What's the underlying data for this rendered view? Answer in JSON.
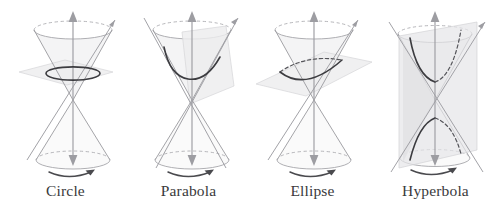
{
  "figure": {
    "background_color": "#ffffff",
    "label_color": "#3a3a3c",
    "curve_color": "#3c3c40",
    "cone_line_color": "#9a9a9e",
    "plane_fill_color": "#ededee"
  },
  "panels": [
    {
      "id": "circle",
      "label": "Circle",
      "conic": "circle",
      "plane_orientation": "horizontal, perpendicular to cone axis",
      "curve_style": "closed oval, solid front and back",
      "axis_icon": "vertical-axis-double-arrow",
      "rotation_icon": "rotation-arrow"
    },
    {
      "id": "parabola",
      "label": "Parabola",
      "conic": "parabola",
      "plane_orientation": "tilted, parallel to a generating line",
      "curve_style": "open upward U curve, solid",
      "axis_icon": "vertical-axis-double-arrow",
      "rotation_icon": "rotation-arrow"
    },
    {
      "id": "ellipse",
      "label": "Ellipse",
      "conic": "ellipse",
      "plane_orientation": "oblique, cutting one nappe",
      "curve_style": "closed oval, solid front and dashed back",
      "axis_icon": "vertical-axis-double-arrow",
      "rotation_icon": "rotation-arrow"
    },
    {
      "id": "hyperbola",
      "label": "Hyperbola",
      "conic": "hyperbola",
      "plane_orientation": "vertical, parallel to the cone axis, cutting both nappes",
      "curve_style": "two opposing branches, solid front and dashed back",
      "axis_icon": "vertical-axis-double-arrow",
      "rotation_icon": "rotation-arrow"
    }
  ]
}
